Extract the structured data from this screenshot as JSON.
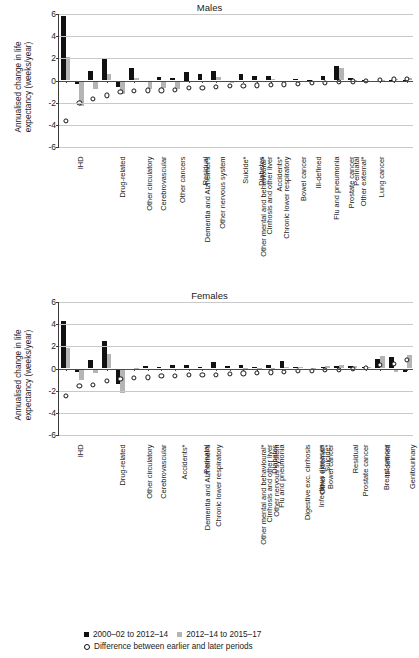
{
  "figure": {
    "ylabel": "Annualised change in life expectancy (weeks/year)",
    "yticks": [
      "6",
      "4",
      "2",
      "0",
      "-2",
      "-4",
      "-6"
    ],
    "ylim": [
      -6,
      6
    ],
    "colors": {
      "early": "#111111",
      "late": "#b5b5b5",
      "difference": "#111111",
      "grid": "#c9c9c9",
      "axis": "#3a3a3a"
    }
  },
  "legend": {
    "early_label": "2000–02 to 2012–14",
    "late_label": "2012–14 to 2015–17",
    "difference_label": "Difference between earlier and later periods"
  },
  "chart_data": [
    {
      "type": "bar",
      "title": "Males",
      "xlabel": "",
      "ylabel": "Annualised change in life expectancy (weeks/year)",
      "ylim": [
        -6,
        6
      ],
      "grid": true,
      "legend_position": "below-figure",
      "categories": [
        "IHD",
        "Drug-related",
        "Other circulatory",
        "Cerebrovascular",
        "Dementia and Alzheimer's",
        "Other cancers",
        "Other nervous system",
        "Other mental and behavioural*",
        "Residual",
        "Cirrhosis and other liver",
        "Chronic lower respiratory",
        "Suicide*",
        "Diabetes",
        "Accidents*",
        "Bowel cancer",
        "Flu and pneumonia",
        "Ill-defined",
        "Prostate cancer",
        "Other external*",
        "Perinatal",
        "Lung cancer",
        "Digestive exc. cirrhosis",
        "Infectious diseases",
        "Breast cancer",
        "Genitourinary",
        "Other respiratory"
      ],
      "series": [
        {
          "name": "2000–02 to 2012–14",
          "values": [
            5.85,
            -0.35,
            0.85,
            1.95,
            -0.55,
            1.15,
            -0.05,
            0.3,
            0.25,
            0.75,
            0.6,
            0.9,
            -0.1,
            0.6,
            0.4,
            0.45,
            -0.05,
            0.15,
            0.05,
            0.45,
            1.3,
            0.2,
            0.05,
            0.0,
            0.05,
            0.02
          ]
        },
        {
          "name": "2012–14 to 2015–17",
          "values": [
            2.1,
            -2.3,
            -0.75,
            0.55,
            -1.2,
            0.25,
            -0.8,
            -0.7,
            -0.75,
            -0.1,
            -0.05,
            0.35,
            -0.2,
            -0.1,
            -0.1,
            0.1,
            -0.05,
            -0.05,
            -0.05,
            -0.1,
            1.1,
            0.05,
            0.0,
            0.02,
            0.15,
            0.2
          ]
        }
      ],
      "difference": {
        "name": "Difference between earlier and later periods",
        "values": [
          -3.65,
          -2.05,
          -1.65,
          -1.35,
          -1.0,
          -0.95,
          -0.9,
          -0.9,
          -0.85,
          -0.65,
          -0.65,
          -0.6,
          -0.5,
          -0.5,
          -0.45,
          -0.4,
          -0.35,
          -0.3,
          -0.25,
          -0.22,
          -0.1,
          -0.08,
          0.0,
          0.05,
          0.1,
          0.18
        ]
      }
    },
    {
      "type": "bar",
      "title": "Females",
      "xlabel": "",
      "ylabel": "Annualised change in life expectancy (weeks/year)",
      "ylim": [
        -6,
        6
      ],
      "grid": true,
      "legend_position": "below-figure",
      "categories": [
        "IHD",
        "Drug-related",
        "Other circulatory",
        "Cerebrovascular",
        "Dementia and Alzheimer's",
        "Chronic lower respiratory",
        "Accidents*",
        "Other mental and behavioural*",
        "Perinatal",
        "Cirrhosis and other liver",
        "Other nervous system",
        "Flu and pneumonia",
        "Digestive exc. cirrhosis",
        "Diabetes",
        "Infectious diseases",
        "Other external*",
        "Bowel cancer",
        "Suicide*",
        "Prostate cancer",
        "Residual",
        "Breast cancer",
        "Ill-defined",
        "Genitourinary",
        "Other cancers",
        "Other respiratory",
        "Lung cancer"
      ],
      "series": [
        {
          "name": "2000–02 to 2012–14",
          "values": [
            4.3,
            -0.35,
            0.8,
            2.5,
            -1.4,
            -0.05,
            0.25,
            0.15,
            0.35,
            0.3,
            0.1,
            0.6,
            0.25,
            0.3,
            0.1,
            0.3,
            0.65,
            0.1,
            0.0,
            0.15,
            0.25,
            0.25,
            0.1,
            0.85,
            1.0,
            -0.35
          ]
        },
        {
          "name": "2012–14 to 2015–17",
          "values": [
            1.85,
            -1.05,
            -0.45,
            1.35,
            -2.2,
            0.05,
            -0.05,
            -0.1,
            -0.05,
            -0.05,
            -0.05,
            -0.05,
            -0.05,
            0.05,
            0.05,
            0.05,
            0.1,
            0.1,
            0.05,
            0.25,
            0.3,
            0.2,
            0.15,
            1.15,
            -0.35,
            1.25
          ]
        }
      ],
      "difference": {
        "name": "Difference between earlier and later periods",
        "values": [
          -2.5,
          -1.6,
          -1.45,
          -1.15,
          -0.95,
          -0.85,
          -0.8,
          -0.7,
          -0.65,
          -0.6,
          -0.6,
          -0.55,
          -0.5,
          -0.45,
          -0.4,
          -0.35,
          -0.3,
          -0.25,
          -0.2,
          -0.15,
          -0.1,
          -0.05,
          0.05,
          0.3,
          0.4,
          0.75
        ]
      }
    }
  ]
}
